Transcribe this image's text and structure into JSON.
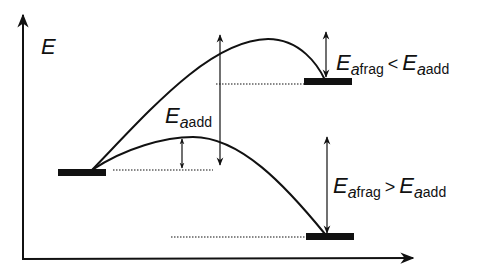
{
  "diagram": {
    "type": "energy-profile",
    "axis_label_y": "E",
    "labels": {
      "ea_add": {
        "E": "E",
        "a": "a",
        "sub": "add"
      },
      "top_condition": {
        "lhs": {
          "E": "E",
          "a": "a",
          "sub": "frag"
        },
        "operator": "<",
        "rhs": {
          "E": "E",
          "a": "a",
          "sub": "add"
        }
      },
      "bottom_condition": {
        "lhs": {
          "E": "E",
          "a": "a",
          "sub": "frag"
        },
        "operator": ">",
        "rhs": {
          "E": "E",
          "a": "a",
          "sub": "add"
        }
      }
    },
    "levels": {
      "reactant": "left bar",
      "product_high": "upper right bar",
      "product_low": "lower right bar"
    },
    "colors": {
      "ink": "#111111",
      "background": "#ffffff"
    }
  }
}
